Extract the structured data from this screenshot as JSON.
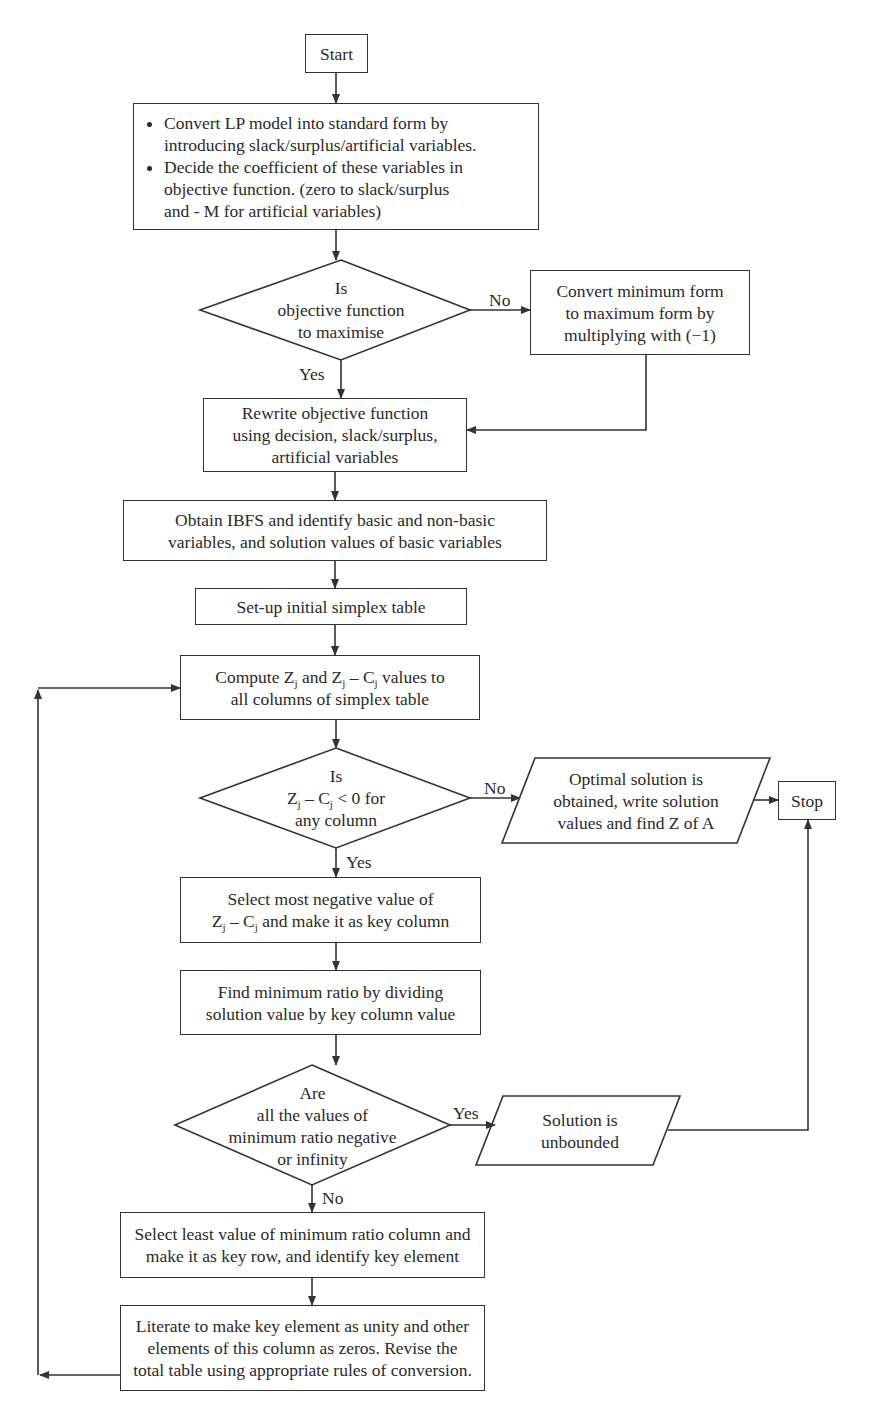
{
  "flowchart": {
    "title": "Simplex Method Flowchart",
    "start": {
      "label": "Start"
    },
    "standard_form": {
      "bullets": [
        [
          "Convert LP model into standard form by",
          "introducing slack/surplus/artificial variables."
        ],
        [
          "Decide the coefficient of these variables in",
          "objective function. (zero to slack/surplus",
          "and - M for artificial variables)"
        ]
      ]
    },
    "decision_maximise": {
      "lines": [
        "Is",
        "objective function",
        "to maximise"
      ],
      "no_label": "No",
      "yes_label": "Yes"
    },
    "convert_min_to_max": {
      "lines": [
        "Convert minimum form",
        "to maximum form by",
        "multiplying with (−1)"
      ]
    },
    "rewrite_objective": {
      "lines": [
        "Rewrite objective function",
        "using decision, slack/surplus,",
        "artificial variables"
      ]
    },
    "obtain_ibfs": {
      "lines": [
        "Obtain IBFS and identify basic and non-basic",
        "variables, and solution values of basic variables"
      ]
    },
    "setup_table": {
      "lines": [
        "Set-up initial simplex table"
      ]
    },
    "compute_zj": {
      "line1": {
        "a": "Compute Z",
        "sub1": "j",
        "b": " and Z",
        "sub2": "j",
        "c": " – C",
        "sub3": "j",
        "d": " values to"
      },
      "line2": "all columns of simplex table"
    },
    "decision_optimal": {
      "line1": "Is",
      "line2": {
        "a": "Z",
        "sub1": "j",
        "b": " – C",
        "sub2": "j",
        "c": " < 0 for"
      },
      "line3": "any column",
      "no_label": "No",
      "yes_label": "Yes"
    },
    "optimal_solution": {
      "lines": [
        "Optimal solution is",
        "obtained, write solution",
        "values and find Z of A"
      ]
    },
    "stop": {
      "label": "Stop"
    },
    "select_key_column": {
      "line1": "Select most negative value of",
      "line2": {
        "a": "Z",
        "sub1": "j",
        "b": " – C",
        "sub2": "j",
        "c": " and make it as key column"
      }
    },
    "min_ratio": {
      "lines": [
        "Find minimum ratio by dividing",
        "solution value by key column value"
      ]
    },
    "decision_unbounded": {
      "lines": [
        "Are",
        "all the values of",
        "minimum ratio negative",
        "or infinity"
      ],
      "yes_label": "Yes",
      "no_label": "No"
    },
    "unbounded": {
      "lines": [
        "Solution is",
        "unbounded"
      ]
    },
    "key_row": {
      "lines": [
        "Select least value of minimum ratio column and",
        "make it as key row, and identify key element"
      ]
    },
    "iterate": {
      "lines": [
        "Literate to make key element as unity and other",
        "elements of this column as zeros. Revise the",
        "total table using appropriate rules of conversion."
      ]
    }
  }
}
